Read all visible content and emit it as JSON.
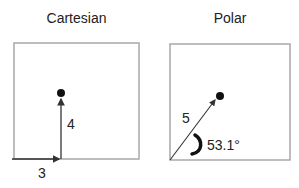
{
  "cartesian": {
    "title": "Cartesian",
    "x_label": "3",
    "y_label": "4"
  },
  "polar": {
    "title": "Polar",
    "r_label": "5",
    "angle_label": "53.1°"
  },
  "colors": {
    "frame": "#a8a8a8",
    "ink": "#111111"
  }
}
